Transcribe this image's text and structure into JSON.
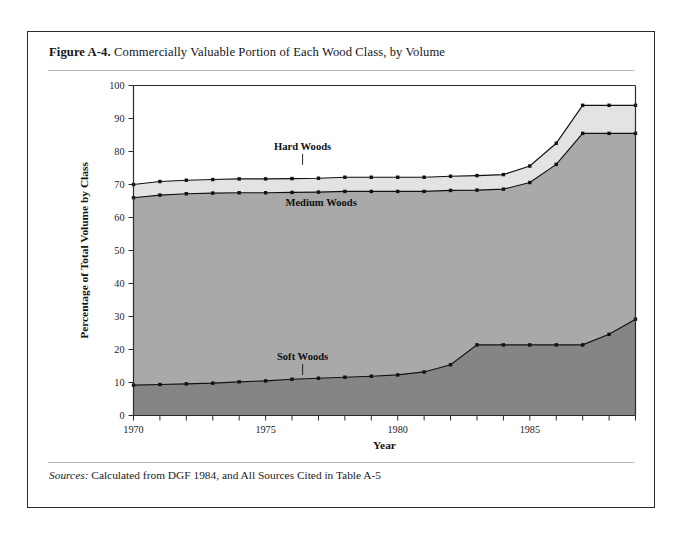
{
  "figure": {
    "label": "Figure A-4.",
    "title": "Commercially Valuable Portion of Each Wood Class, by Volume",
    "sources_label": "Sources:",
    "sources_text": "Calculated from DGF 1984, and All Sources Cited in Table A-5"
  },
  "chart_data": {
    "type": "area",
    "title": "Commercially Valuable Portion of Each Wood Class, by Volume",
    "xlabel": "Year",
    "ylabel": "Percentage of Total Volume by Class",
    "xlim": [
      1970,
      1989
    ],
    "ylim": [
      0,
      100
    ],
    "ytick_step": 10,
    "yticks": [
      "0",
      "10",
      "20",
      "30",
      "40",
      "50",
      "60",
      "70",
      "80",
      "90",
      "100"
    ],
    "xticks_labeled": [
      "1970",
      "1975",
      "1980",
      "1985"
    ],
    "xtick_every": 1,
    "grid": false,
    "legend": "inline-annotations",
    "stacked": true,
    "x": [
      1970,
      1971,
      1972,
      1973,
      1974,
      1975,
      1976,
      1977,
      1978,
      1979,
      1980,
      1981,
      1982,
      1983,
      1984,
      1985,
      1986,
      1987,
      1988,
      1989
    ],
    "series": [
      {
        "name": "Soft Woods",
        "color": "#858585",
        "values": [
          9.2,
          9.4,
          9.6,
          9.8,
          10.2,
          10.5,
          11.0,
          11.3,
          11.6,
          11.9,
          12.3,
          13.2,
          15.4,
          21.4,
          21.4,
          21.4,
          21.4,
          21.4,
          24.6,
          29.2
        ]
      },
      {
        "name": "Medium Woods",
        "color": "#a9a9a9",
        "values": [
          56.8,
          57.4,
          57.6,
          57.6,
          57.3,
          57.0,
          56.6,
          56.4,
          56.3,
          56.0,
          55.6,
          54.7,
          52.8,
          46.9,
          47.2,
          49.2,
          54.7,
          64.1,
          60.9,
          56.3
        ]
      },
      {
        "name": "Hard Woods",
        "color": "#e3e3e3",
        "values": [
          4.0,
          4.1,
          4.1,
          4.1,
          4.2,
          4.2,
          4.2,
          4.2,
          4.3,
          4.3,
          4.3,
          4.3,
          4.3,
          4.4,
          4.4,
          5.0,
          6.4,
          8.5,
          8.5,
          8.5
        ]
      }
    ],
    "cumulative": {
      "soft_woods_top": [
        9.2,
        9.4,
        9.6,
        9.8,
        10.2,
        10.5,
        11.0,
        11.3,
        11.6,
        11.9,
        12.3,
        13.2,
        15.4,
        21.4,
        21.4,
        21.4,
        21.4,
        21.4,
        24.6,
        29.2
      ],
      "medium_woods_top": [
        66.0,
        66.8,
        67.2,
        67.4,
        67.5,
        67.5,
        67.6,
        67.7,
        67.9,
        67.9,
        67.9,
        67.9,
        68.2,
        68.3,
        68.6,
        70.6,
        76.1,
        85.5,
        85.5,
        85.5
      ],
      "hard_woods_top": [
        70.0,
        70.9,
        71.3,
        71.5,
        71.7,
        71.7,
        71.8,
        71.9,
        72.2,
        72.2,
        72.2,
        72.2,
        72.5,
        72.7,
        73.0,
        75.6,
        82.5,
        94.0,
        94.0,
        94.0
      ]
    },
    "annotations": [
      {
        "text": "Hard Woods",
        "x": 1976.4,
        "y": 80.5
      },
      {
        "text": "Medium Woods",
        "x": 1977.1,
        "y": 63.5
      },
      {
        "text": "Soft Woods",
        "x": 1976.4,
        "y": 16.8
      }
    ],
    "colors": {
      "hard_woods": "#e3e3e3",
      "medium_woods": "#a9a9a9",
      "soft_woods": "#858585",
      "line": "#111111",
      "axis": "#2b2b2b"
    }
  }
}
